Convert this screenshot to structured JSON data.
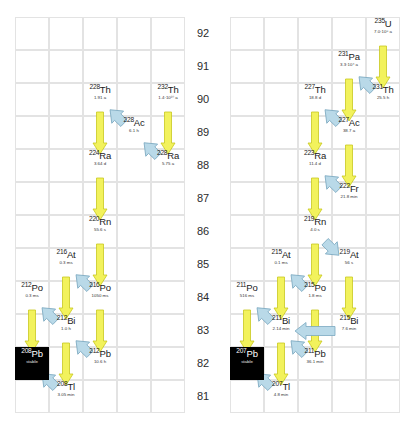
{
  "figure": {
    "panels": 2,
    "axis_name": "Atomic number Z",
    "axis_labels": [
      "92",
      "91",
      "90",
      "89",
      "88",
      "87",
      "86",
      "85",
      "84",
      "83",
      "82",
      "81"
    ],
    "colors": {
      "alpha_arrow_fill": "#f2f25c",
      "alpha_arrow_stroke": "#c8c820",
      "beta_arrow_fill": "#b9d9e8",
      "beta_arrow_stroke": "#7aa8c0",
      "grid_line": "#e3e3e3",
      "stable_box": "#000000",
      "text": "#1a1a1a"
    }
  },
  "chart_data": {
    "type": "diagram",
    "ylabel": "Atomic number Z",
    "ylim": [
      81,
      92
    ],
    "grid": true,
    "legend": "none",
    "series": [
      {
        "name": "Thorium series (left panel)",
        "nuclides": [
          {
            "mass": "232",
            "element": "Th",
            "z": 90,
            "col": 4,
            "half_life": "1.4·10¹⁰ a",
            "stable": false
          },
          {
            "mass": "228",
            "element": "Ra",
            "z": 88,
            "col": 4,
            "half_life": "5.75 a",
            "stable": false
          },
          {
            "mass": "228",
            "element": "Ac",
            "z": 89,
            "col": 3,
            "half_life": "6.1 h",
            "stable": false
          },
          {
            "mass": "228",
            "element": "Th",
            "z": 90,
            "col": 2,
            "half_life": "1.91 a",
            "stable": false
          },
          {
            "mass": "224",
            "element": "Ra",
            "z": 88,
            "col": 2,
            "half_life": "3.64 d",
            "stable": false
          },
          {
            "mass": "220",
            "element": "Rn",
            "z": 86,
            "col": 2,
            "half_life": "55.6 s",
            "stable": false
          },
          {
            "mass": "216",
            "element": "Po",
            "z": 84,
            "col": 2,
            "half_life": "1050 ms",
            "stable": false
          },
          {
            "mass": "216",
            "element": "At",
            "z": 85,
            "col": 1,
            "half_life": "0.3 ms",
            "stable": false
          },
          {
            "mass": "212",
            "element": "Po",
            "z": 84,
            "col": 0,
            "half_life": "0.3 ms",
            "stable": false
          },
          {
            "mass": "212",
            "element": "Bi",
            "z": 83,
            "col": 1,
            "half_life": "1.0 h",
            "stable": false
          },
          {
            "mass": "212",
            "element": "Pb",
            "z": 82,
            "col": 2,
            "half_life": "10.6 h",
            "stable": false
          },
          {
            "mass": "208",
            "element": "Tl",
            "z": 81,
            "col": 1,
            "half_life": "3.05 min",
            "stable": false
          },
          {
            "mass": "208",
            "element": "Pb",
            "z": 82,
            "col": 0,
            "half_life": "stable",
            "stable": true
          }
        ],
        "decays": [
          {
            "from": "232Th",
            "to": "228Ra",
            "type": "alpha"
          },
          {
            "from": "228Ra",
            "to": "228Ac",
            "type": "beta"
          },
          {
            "from": "228Ac",
            "to": "228Th",
            "type": "beta"
          },
          {
            "from": "228Th",
            "to": "224Ra",
            "type": "alpha"
          },
          {
            "from": "224Ra",
            "to": "220Rn",
            "type": "alpha"
          },
          {
            "from": "220Rn",
            "to": "216Po",
            "type": "alpha"
          },
          {
            "from": "216Po",
            "to": "216At",
            "type": "beta"
          },
          {
            "from": "216Po",
            "to": "212Pb",
            "type": "alpha"
          },
          {
            "from": "216At",
            "to": "212Bi",
            "type": "alpha"
          },
          {
            "from": "212Pb",
            "to": "212Bi",
            "type": "beta"
          },
          {
            "from": "212Bi",
            "to": "212Po",
            "type": "beta"
          },
          {
            "from": "212Po",
            "to": "208Pb",
            "type": "alpha"
          },
          {
            "from": "212Bi",
            "to": "208Tl",
            "type": "alpha"
          },
          {
            "from": "208Tl",
            "to": "208Pb",
            "type": "beta"
          }
        ]
      },
      {
        "name": "Actinium series (right panel)",
        "nuclides": [
          {
            "mass": "235",
            "element": "U",
            "z": 92,
            "col": 4,
            "half_life": "7.0·10⁸ a",
            "stable": false
          },
          {
            "mass": "231",
            "element": "Th",
            "z": 90,
            "col": 4,
            "half_life": "25.5 h",
            "stable": false
          },
          {
            "mass": "231",
            "element": "Pa",
            "z": 91,
            "col": 3,
            "half_life": "3.3·10⁴ a",
            "stable": false
          },
          {
            "mass": "227",
            "element": "Ac",
            "z": 89,
            "col": 3,
            "half_life": "38.7 a",
            "stable": false
          },
          {
            "mass": "227",
            "element": "Th",
            "z": 90,
            "col": 2,
            "half_life": "18.8 d",
            "stable": false
          },
          {
            "mass": "223",
            "element": "Ra",
            "z": 88,
            "col": 2,
            "half_life": "11.4 d",
            "stable": false
          },
          {
            "mass": "222",
            "element": "Fr",
            "z": 87,
            "col": 3,
            "half_life": "21.8 min",
            "stable": false
          },
          {
            "mass": "219",
            "element": "Rn",
            "z": 86,
            "col": 2,
            "half_life": "4.0 s",
            "stable": false
          },
          {
            "mass": "219",
            "element": "At",
            "z": 85,
            "col": 3,
            "half_life": "56 s",
            "stable": false
          },
          {
            "mass": "215",
            "element": "At",
            "z": 85,
            "col": 1,
            "half_life": "0.1 ms",
            "stable": false
          },
          {
            "mass": "215",
            "element": "Po",
            "z": 84,
            "col": 2,
            "half_life": "1.8 ms",
            "stable": false
          },
          {
            "mass": "211",
            "element": "Po",
            "z": 84,
            "col": 0,
            "half_life": "516 ms",
            "stable": false
          },
          {
            "mass": "215",
            "element": "Bi",
            "z": 83,
            "col": 3,
            "half_life": "7.6 min",
            "stable": false
          },
          {
            "mass": "211",
            "element": "Bi",
            "z": 83,
            "col": 1,
            "half_life": "2.14 min",
            "stable": false
          },
          {
            "mass": "211",
            "element": "Pb",
            "z": 82,
            "col": 2,
            "half_life": "36.1 min",
            "stable": false
          },
          {
            "mass": "207",
            "element": "Tl",
            "z": 81,
            "col": 1,
            "half_life": "4.8 min",
            "stable": false
          },
          {
            "mass": "207",
            "element": "Pb",
            "z": 82,
            "col": 0,
            "half_life": "stable",
            "stable": true
          }
        ],
        "decays": [
          {
            "from": "235U",
            "to": "231Th",
            "type": "alpha"
          },
          {
            "from": "231Th",
            "to": "231Pa",
            "type": "beta"
          },
          {
            "from": "231Pa",
            "to": "227Ac",
            "type": "alpha"
          },
          {
            "from": "227Ac",
            "to": "227Th",
            "type": "beta"
          },
          {
            "from": "227Th",
            "to": "223Ra",
            "type": "alpha"
          },
          {
            "from": "227Ac",
            "to": "222Fr",
            "type": "alpha"
          },
          {
            "from": "222Fr",
            "to": "223Ra",
            "type": "beta"
          },
          {
            "from": "223Ra",
            "to": "219Rn",
            "type": "alpha"
          },
          {
            "from": "219Rn",
            "to": "215Po",
            "type": "alpha"
          },
          {
            "from": "219At",
            "to": "215Bi",
            "type": "alpha"
          },
          {
            "from": "219Rn",
            "to": "219At",
            "type": "beta"
          },
          {
            "from": "215Po",
            "to": "215At",
            "type": "beta"
          },
          {
            "from": "215Po",
            "to": "211Pb",
            "type": "alpha"
          },
          {
            "from": "215At",
            "to": "211Bi",
            "type": "alpha"
          },
          {
            "from": "215Bi",
            "to": "211Bi",
            "type": "beta"
          },
          {
            "from": "211Pb",
            "to": "211Bi",
            "type": "beta"
          },
          {
            "from": "211Bi",
            "to": "211Po",
            "type": "beta"
          },
          {
            "from": "211Po",
            "to": "207Pb",
            "type": "alpha"
          },
          {
            "from": "211Bi",
            "to": "207Tl",
            "type": "alpha"
          },
          {
            "from": "207Tl",
            "to": "207Pb",
            "type": "beta"
          }
        ]
      }
    ]
  }
}
